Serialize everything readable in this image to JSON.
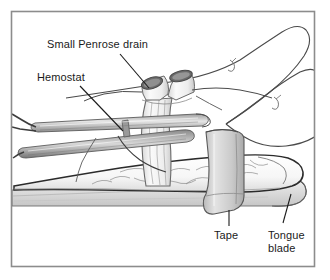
{
  "figure": {
    "background_color": "#ffffff",
    "frame": {
      "name": "figure-border",
      "color": "#8c8c8c",
      "x": 11,
      "y": 11,
      "width": 304,
      "height": 256
    },
    "labels": [
      {
        "id": "penrose",
        "text": "Small Penrose drain",
        "x": 47,
        "y": 38,
        "leader": {
          "from": [
            120,
            54
          ],
          "to": [
            149,
            88
          ]
        }
      },
      {
        "id": "hemostat",
        "text": "Hemostat",
        "x": 37,
        "y": 71,
        "leader": {
          "from": [
            80,
            86
          ],
          "to": [
            123,
            131
          ]
        }
      },
      {
        "id": "tape",
        "text": "Tape",
        "x": 214,
        "y": 229,
        "leader": {
          "from": [
            229,
            210
          ],
          "to": [
            229,
            226
          ]
        }
      },
      {
        "id": "tongue-blade",
        "text": "Tongue blade",
        "line1": "Tongue",
        "line2": "blade",
        "x": 268,
        "y": 229,
        "leader": {
          "from": [
            291,
            194
          ],
          "to": [
            283,
            223
          ]
        }
      }
    ],
    "parts": [
      {
        "name": "small-penrose-drain",
        "description": "pale looped rubber drain with two dark elliptical open ends, draped over the hemostat and wrapped around the finger base"
      },
      {
        "name": "hemostat",
        "description": "long slender surgical clamp angled from lower left to upper right, jaws gripping the drain"
      },
      {
        "name": "finger",
        "description": "patient index finger lying horizontally with two adjacent fingers outlined above right"
      },
      {
        "name": "tape",
        "description": "vertical gray adhesive strip wrapping finger and tongue blade"
      },
      {
        "name": "tongue-blade",
        "description": "flat wooden splint with rounded end running under the finger"
      }
    ],
    "colors": {
      "ink": "#1b1b1b",
      "outline": "#3a3a3a",
      "light_outline": "#808080",
      "skin_fill": "#fbfbfb",
      "skin_shade": "#e8e8e8",
      "drain_fill": "#f2f2f2",
      "drain_dark": "#6e6e6e",
      "metal_light": "#dcdcdc",
      "metal_dark": "#7a7a7a",
      "tape_fill": "#cfcfcf",
      "blade_fill": "#dadada"
    }
  }
}
